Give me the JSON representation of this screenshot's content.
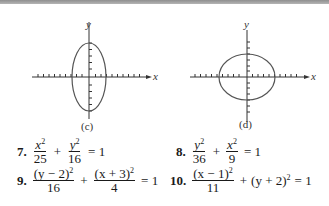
{
  "figures": [
    {
      "id": "c",
      "caption": "(c)",
      "x_label": "x",
      "y_label": "y",
      "shape": "ellipse",
      "orientation": "vertical",
      "center_px": [
        89,
        77
      ],
      "semi_axes_px": [
        17,
        34
      ]
    },
    {
      "id": "d",
      "caption": "(d)",
      "x_label": "x",
      "y_label": "y",
      "shape": "ellipse",
      "orientation": "horizontal",
      "center_px": [
        247,
        77
      ],
      "semi_axes_px": [
        28,
        23
      ]
    }
  ],
  "exercises": [
    {
      "number": "7.",
      "term1_num": "x",
      "term1_num_exp": "2",
      "term1_den": "25",
      "op": "+",
      "term2_num": "y",
      "term2_num_exp": "2",
      "term2_den": "16",
      "rhs": "= 1"
    },
    {
      "number": "8.",
      "term1_num": "y",
      "term1_num_exp": "2",
      "term1_den": "36",
      "op": "+",
      "term2_num": "x",
      "term2_num_exp": "2",
      "term2_den": "9",
      "rhs": "= 1"
    },
    {
      "number": "9.",
      "term1_num": "(y − 2)",
      "term1_num_exp": "2",
      "term1_den": "16",
      "op": "+",
      "term2_num": "(x + 3)",
      "term2_num_exp": "2",
      "term2_den": "4",
      "rhs": "= 1"
    },
    {
      "number": "10.",
      "term1_num": "(x − 1)",
      "term1_num_exp": "2",
      "term1_den": "11",
      "op": "+",
      "term2_plain": "(y + 2)",
      "term2_plain_exp": "2",
      "rhs": "= 1"
    }
  ]
}
